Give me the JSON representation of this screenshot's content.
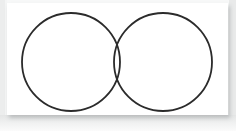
{
  "figure": {
    "name": "two-set-venn-diagram",
    "type": "venn-diagram",
    "title": "",
    "caption": "",
    "background_color": "#f7f8f8",
    "panel_color": "#ffffff",
    "stroke_color": "#2b2b2b",
    "stroke_width": 1.8,
    "fill_color": "none",
    "panel": {
      "x": 7,
      "y": 3,
      "width": 221,
      "height": 112
    },
    "sets": [
      {
        "id": "set-a",
        "label": "",
        "center_x": 64,
        "center_y": 59,
        "radius": 49,
        "stroke_color": "#2b2b2b"
      },
      {
        "id": "set-b",
        "label": "",
        "center_x": 156,
        "center_y": 59,
        "radius": 49,
        "stroke_color": "#2b2b2b"
      }
    ],
    "intersection": {
      "label": "",
      "upper_point_x": 110,
      "upper_point_y": 19,
      "lower_point_x": 110,
      "lower_point_y": 100
    },
    "region_labels": []
  },
  "chart_data": {
    "type": "diagram",
    "subtype": "venn",
    "title": "",
    "series": [
      {
        "name": "set-a",
        "cx": 64,
        "cy": 59,
        "r": 49
      },
      {
        "name": "set-b",
        "cx": 156,
        "cy": 59,
        "r": 49
      }
    ],
    "overlap": true,
    "labels": [],
    "legend": []
  }
}
